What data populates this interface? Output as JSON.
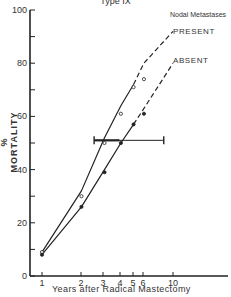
{
  "chart_data": {
    "type": "line",
    "title": "Type IX",
    "xlabel": "Years after Radical Mastectomy",
    "ylabel": "% MORTALITY",
    "x_scale": "log",
    "xlim": [
      1,
      10
    ],
    "ylim": [
      0,
      100
    ],
    "x_ticks": [
      1,
      2,
      3,
      4,
      5,
      6,
      10
    ],
    "y_ticks": [
      0,
      20,
      40,
      60,
      80,
      100
    ],
    "y_minor_ticks": [
      10,
      30,
      50,
      70,
      90
    ],
    "grid": false,
    "legend": {
      "title": "Nodal Metastases",
      "entries": [
        "PRESENT",
        "ABSENT"
      ],
      "position": "upper right"
    },
    "series": [
      {
        "name": "PRESENT",
        "marker": "open-circle",
        "line": "solid then dashed extrapolation",
        "points": [
          {
            "x": 1,
            "y": 9
          },
          {
            "x": 2,
            "y": 30
          },
          {
            "x": 3,
            "y": 50
          },
          {
            "x": 4,
            "y": 61
          },
          {
            "x": 5,
            "y": 71
          },
          {
            "x": 6,
            "y": 74
          }
        ],
        "curve": [
          [
            1,
            9
          ],
          [
            2,
            32
          ],
          [
            3,
            52
          ],
          [
            4,
            64
          ],
          [
            5,
            72
          ],
          [
            6,
            80
          ],
          [
            10,
            92
          ]
        ]
      },
      {
        "name": "ABSENT",
        "marker": "filled-circle",
        "line": "solid then dashed extrapolation",
        "points": [
          {
            "x": 1,
            "y": 8
          },
          {
            "x": 2,
            "y": 26
          },
          {
            "x": 3,
            "y": 39
          },
          {
            "x": 4,
            "y": 50
          },
          {
            "x": 5,
            "y": 57
          },
          {
            "x": 6,
            "y": 61
          }
        ],
        "curve": [
          [
            1,
            8
          ],
          [
            2,
            26
          ],
          [
            3,
            40
          ],
          [
            4,
            50
          ],
          [
            5,
            57
          ],
          [
            6,
            63
          ],
          [
            10,
            80
          ]
        ]
      }
    ],
    "annotations": [
      {
        "type": "horizontal-range-bar",
        "y": 51,
        "x_from": 2.5,
        "x_to": 8.5,
        "thick_from": 2.5,
        "thick_to": 3.9
      }
    ]
  },
  "labels": {
    "title": "Type IX",
    "xlabel": "Years after Radical Mastectomy",
    "ylabel": "% MORTALITY",
    "legend_title": "Nodal Metastases",
    "legend_present": "PRESENT",
    "legend_absent": "ABSENT"
  },
  "axis_px": {
    "x_origin": 30,
    "y_zero": 276,
    "y_hundred": 10,
    "x_tick_px": {
      "1": 42,
      "2": 81,
      "3": 103,
      "4": 120,
      "5": 133,
      "6": 143,
      "10": 173
    }
  }
}
